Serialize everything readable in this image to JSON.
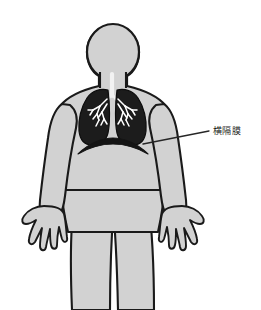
{
  "figure": {
    "background_color": "#ffffff",
    "width": 261,
    "height": 310
  },
  "colors": {
    "background": "#ffffff",
    "body_fill": "#d2d2d2",
    "body_outline": "#1a1a1a",
    "lung_fill": "#1c1c1c",
    "bronchi": "#ffffff",
    "diaphragm": "#141414",
    "leader_line": "#262626",
    "label_text": "#1d1d1d"
  },
  "body": {
    "view": "anterior",
    "parts": [
      {
        "name": "head",
        "label": ""
      },
      {
        "name": "neck",
        "label": ""
      },
      {
        "name": "torso",
        "label": ""
      },
      {
        "name": "left-arm",
        "label": ""
      },
      {
        "name": "right-arm",
        "label": ""
      },
      {
        "name": "left-hand",
        "label": ""
      },
      {
        "name": "right-hand",
        "label": ""
      },
      {
        "name": "left-leg",
        "label": ""
      },
      {
        "name": "right-leg",
        "label": ""
      }
    ]
  },
  "organs": {
    "trachea": {
      "name": "trachea",
      "label": ""
    },
    "lung_left": {
      "name": "left-lung",
      "label": ""
    },
    "lung_right": {
      "name": "right-lung",
      "label": ""
    },
    "bronchial_tree": {
      "name": "bronchial-tree",
      "label": ""
    },
    "diaphragm": {
      "name": "diaphragm",
      "label": ""
    }
  },
  "annotations": [
    {
      "id": "diaphragm",
      "text": "横隔膜",
      "leader_from_x": 143,
      "leader_from_y": 144,
      "leader_to_x": 209,
      "leader_to_y": 131
    }
  ]
}
